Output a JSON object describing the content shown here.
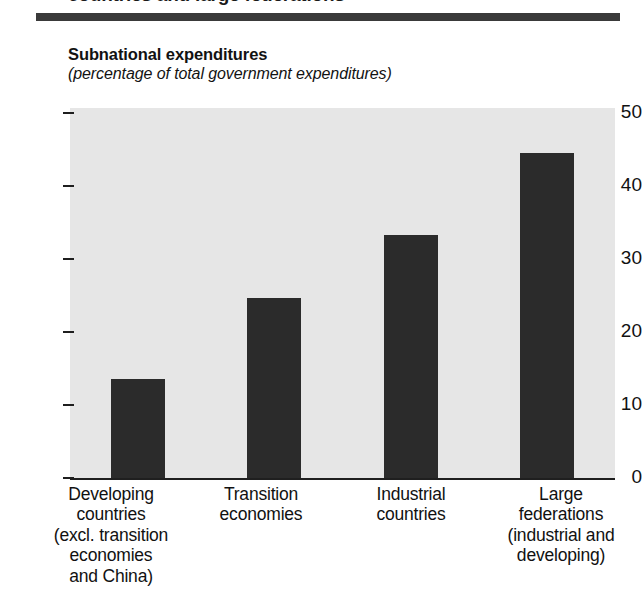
{
  "page": {
    "heading": "countries and large federations"
  },
  "chart": {
    "title": "Subnational expenditures",
    "subtitle": "(percentage of total government expenditures)"
  },
  "chart_data": {
    "type": "bar",
    "title": "Subnational expenditures",
    "subtitle": "(percentage of total government expenditures)",
    "xlabel": "",
    "ylabel": "percentage of total government expenditures",
    "ylim": [
      0,
      50
    ],
    "yticks": [
      0,
      10,
      20,
      30,
      40,
      50
    ],
    "ytick_labels": [
      "0",
      "10",
      "20",
      "30",
      "40",
      "50"
    ],
    "grid": false,
    "legend": "none",
    "bar_color": "#2b2b2b",
    "plot_background": "#e6e6e6",
    "categories": [
      "Developing countries (excl. transition economies and China)",
      "Transition economies",
      "Industrial countries",
      "Large federations (industrial and developing)"
    ],
    "category_lines": [
      [
        "Developing",
        "countries",
        "(excl. transition",
        "economies",
        "and China)"
      ],
      [
        "Transition",
        "economies"
      ],
      [
        "Industrial",
        "countries"
      ],
      [
        "Large",
        "federations",
        "(industrial and",
        "developing)"
      ]
    ],
    "values": [
      13.6,
      24.7,
      33.3,
      44.5
    ]
  }
}
